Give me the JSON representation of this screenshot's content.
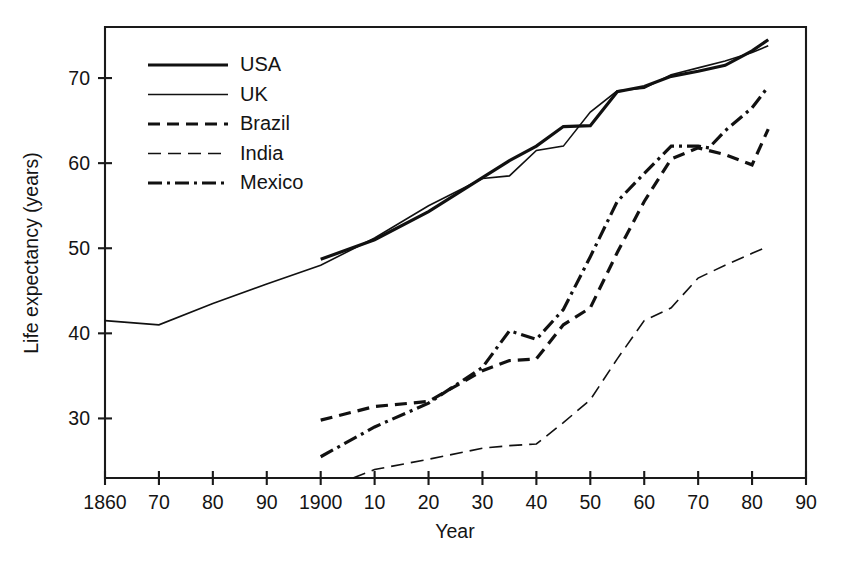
{
  "chart_data": {
    "type": "line",
    "title": "",
    "xlabel": "Year",
    "ylabel": "Life expectancy (years)",
    "xlim": [
      1860,
      1990
    ],
    "ylim": [
      23,
      76
    ],
    "grid": false,
    "legend_position": "upper-left-inside",
    "x_tick_values": [
      1860,
      1870,
      1880,
      1890,
      1900,
      1910,
      1920,
      1930,
      1940,
      1950,
      1960,
      1970,
      1980,
      1990
    ],
    "x_tick_labels": [
      "1860",
      "70",
      "80",
      "90",
      "1900",
      "10",
      "20",
      "30",
      "40",
      "50",
      "60",
      "70",
      "80",
      "90"
    ],
    "y_tick_values": [
      30,
      40,
      50,
      60,
      70
    ],
    "y_tick_labels": [
      "30",
      "40",
      "50",
      "60",
      "70"
    ],
    "series": [
      {
        "name": "USA",
        "style": "solid-thick",
        "stroke_width": 3.2,
        "dash": "none",
        "x": [
          1900,
          1910,
          1920,
          1930,
          1935,
          1940,
          1945,
          1950,
          1955,
          1960,
          1965,
          1970,
          1975,
          1980,
          1983
        ],
        "values": [
          48.7,
          51.0,
          54.3,
          58.3,
          60.3,
          62.0,
          64.3,
          64.4,
          68.4,
          69.0,
          70.2,
          70.8,
          71.5,
          73.2,
          74.5
        ]
      },
      {
        "name": "UK",
        "style": "solid-thin",
        "stroke_width": 1.6,
        "dash": "none",
        "x": [
          1860,
          1870,
          1880,
          1890,
          1900,
          1910,
          1920,
          1930,
          1935,
          1940,
          1945,
          1950,
          1955,
          1960,
          1965,
          1970,
          1975,
          1980,
          1983
        ],
        "values": [
          41.5,
          41.0,
          43.5,
          45.8,
          48.0,
          51.2,
          55.0,
          58.2,
          58.5,
          61.5,
          62.0,
          66.0,
          68.5,
          68.8,
          70.4,
          71.2,
          72.0,
          73.0,
          73.8
        ]
      },
      {
        "name": "Brazil",
        "style": "dashed",
        "stroke_width": 3.2,
        "dash": "12,7",
        "x": [
          1900,
          1910,
          1920,
          1930,
          1935,
          1940,
          1945,
          1950,
          1955,
          1960,
          1965,
          1970,
          1975,
          1980,
          1983
        ],
        "values": [
          29.8,
          31.4,
          32.0,
          35.6,
          36.8,
          37.0,
          41.0,
          43.0,
          49.5,
          55.5,
          60.5,
          61.8,
          61.0,
          59.8,
          64.0
        ]
      },
      {
        "name": "India",
        "style": "long-dash-thin",
        "stroke_width": 1.6,
        "dash": "13,7",
        "x": [
          1906,
          1910,
          1920,
          1930,
          1935,
          1940,
          1945,
          1950,
          1955,
          1960,
          1965,
          1970,
          1975,
          1980,
          1983
        ],
        "values": [
          23.0,
          24.0,
          25.2,
          26.5,
          26.8,
          27.0,
          29.5,
          32.2,
          37.0,
          41.5,
          43.0,
          46.5,
          48.0,
          49.4,
          50.2
        ]
      },
      {
        "name": "Mexico",
        "style": "dash-dot",
        "stroke_width": 3.2,
        "dash": "14,5,3,5",
        "x": [
          1900,
          1910,
          1920,
          1930,
          1935,
          1940,
          1945,
          1950,
          1955,
          1960,
          1965,
          1970,
          1972,
          1975,
          1980,
          1983
        ],
        "values": [
          25.5,
          29.0,
          31.8,
          36.0,
          40.3,
          39.3,
          42.8,
          49.0,
          55.5,
          58.8,
          62.0,
          62.0,
          61.8,
          63.8,
          66.5,
          69.0
        ]
      }
    ]
  },
  "legend": {
    "entries": [
      {
        "label": "USA"
      },
      {
        "label": "UK"
      },
      {
        "label": "Brazil"
      },
      {
        "label": "India"
      },
      {
        "label": "Mexico"
      }
    ]
  }
}
